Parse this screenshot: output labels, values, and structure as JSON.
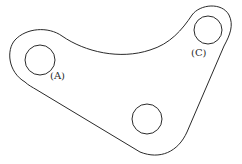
{
  "diagram": {
    "type": "mechanical-part-outline",
    "stroke_color": "#2a2a2a",
    "background": "#ffffff",
    "holes": [
      {
        "id": "A",
        "label": "(A)",
        "cx": 40,
        "cy": 60,
        "r": 15
      },
      {
        "id": "C",
        "label": "(C)",
        "cx": 208,
        "cy": 30,
        "r": 14
      },
      {
        "id": "B",
        "label": "",
        "cx": 147,
        "cy": 119,
        "r": 15
      }
    ],
    "labels": {
      "hole_a": "(A)",
      "hole_c": "(C)"
    }
  }
}
